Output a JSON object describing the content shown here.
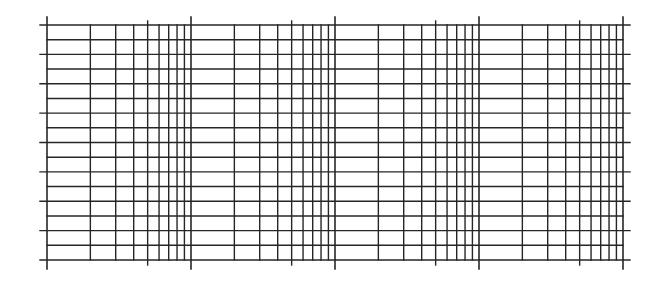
{
  "diagram": {
    "type": "semi-log graph paper",
    "x_axis": {
      "scale": "log",
      "decades": 4,
      "minor_lines_per_decade": [
        2,
        3,
        4,
        5,
        6,
        7,
        8,
        9
      ],
      "tick_extended_at": [
        5
      ]
    },
    "y_axis": {
      "scale": "linear",
      "divisions": 16,
      "major_every": 2
    },
    "colors": {
      "background": "#ffffff",
      "line": "#262626"
    },
    "geometry": {
      "left": 47,
      "right": 623,
      "top": 25,
      "bottom": 260,
      "major_h_left_ext": 40,
      "major_h_right_ext": 630,
      "decade_v_top_ext": 17,
      "decade_v_bottom_ext": 269,
      "mid_v_top_ext": 21,
      "mid_v_bottom_ext": 265
    }
  }
}
